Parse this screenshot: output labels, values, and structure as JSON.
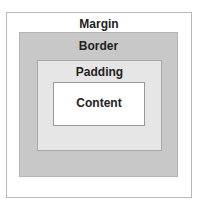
{
  "layers": {
    "margin": "Margin",
    "border": "Border",
    "padding": "Padding",
    "content": "Content"
  }
}
